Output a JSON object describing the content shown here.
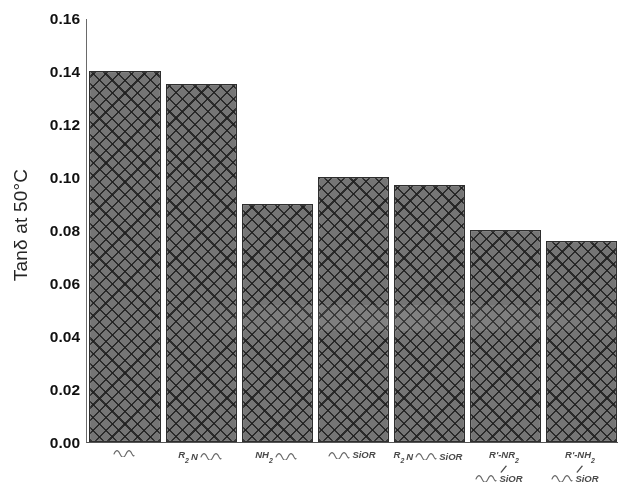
{
  "chart_data": {
    "type": "bar",
    "title": "",
    "subtitle": "",
    "xlabel": "",
    "ylabel": "Tanδ at 50°C",
    "ylim": [
      0.0,
      0.16
    ],
    "ytick_labels": [
      "0.16",
      "0.14",
      "0.12",
      "0.10",
      "0.08",
      "0.06",
      "0.04",
      "0.02",
      "0.00"
    ],
    "ytick_values": [
      0.16,
      0.14,
      0.12,
      0.1,
      0.08,
      0.06,
      0.04,
      0.02,
      0.0
    ],
    "grid": false,
    "legend": null,
    "bar_color": "#757575",
    "bar_edge_color": "#2e2e2e",
    "bar_pattern": "crosshatch-diagonal",
    "categories": [
      "∿",
      "R₂N ∿",
      "NH₂ ∿",
      "∿ SiOR",
      "R₂N∿ SiOR",
      "R'-NR₂ / ∿SiOR",
      "R'-NH₂ / ∿SiOR"
    ],
    "values": [
      0.14,
      0.135,
      0.09,
      0.1,
      0.097,
      0.08,
      0.076
    ]
  },
  "x_labels": [
    {
      "id": "label-plain-chain",
      "lines": [
        {
          "parts": [
            {
              "type": "squiggle"
            }
          ]
        }
      ]
    },
    {
      "id": "label-r2n",
      "lines": [
        {
          "parts": [
            {
              "type": "text",
              "text": "R",
              "sub": "2"
            },
            {
              "type": "text",
              "text": "N"
            },
            {
              "type": "squiggle"
            }
          ]
        }
      ]
    },
    {
      "id": "label-nh2",
      "lines": [
        {
          "parts": [
            {
              "type": "text",
              "text": "NH",
              "sub": "2"
            },
            {
              "type": "squiggle"
            }
          ]
        }
      ]
    },
    {
      "id": "label-sior",
      "lines": [
        {
          "parts": [
            {
              "type": "squiggle"
            },
            {
              "type": "text",
              "text": "SiOR"
            }
          ]
        }
      ]
    },
    {
      "id": "label-r2n-sior",
      "lines": [
        {
          "parts": [
            {
              "type": "text",
              "text": "R",
              "sub": "2"
            },
            {
              "type": "text",
              "text": "N"
            },
            {
              "type": "squiggle"
            },
            {
              "type": "text",
              "text": "SiOR"
            }
          ]
        }
      ]
    },
    {
      "id": "label-rprime-nr2-sior",
      "lines": [
        {
          "parts": [
            {
              "type": "text",
              "text": "R'-NR",
              "sub": "2"
            }
          ]
        },
        {
          "slash": true
        },
        {
          "parts": [
            {
              "type": "squiggle"
            },
            {
              "type": "text",
              "text": "SiOR"
            }
          ],
          "offset": -10
        }
      ]
    },
    {
      "id": "label-rprime-nh2-sior",
      "lines": [
        {
          "parts": [
            {
              "type": "text",
              "text": "R'-NH",
              "sub": "2"
            }
          ]
        },
        {
          "slash": true
        },
        {
          "parts": [
            {
              "type": "squiggle"
            },
            {
              "type": "text",
              "text": "SiOR"
            }
          ],
          "offset": -10
        }
      ]
    }
  ],
  "axis": {
    "y_title": "Tanδ at 50°C",
    "y_max_label": "0.16",
    "y_min_label": "0.00"
  }
}
